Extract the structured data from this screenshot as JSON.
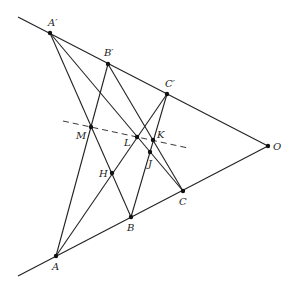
{
  "diagram": {
    "points": {
      "A_prime": {
        "label": "A′",
        "x": 50,
        "y": 33
      },
      "B_prime": {
        "label": "B′",
        "x": 108,
        "y": 64
      },
      "C_prime": {
        "label": "C′",
        "x": 167,
        "y": 94
      },
      "O": {
        "label": "O",
        "x": 268,
        "y": 146
      },
      "A": {
        "label": "A",
        "x": 56,
        "y": 256
      },
      "B": {
        "label": "B",
        "x": 131,
        "y": 217
      },
      "C": {
        "label": "C",
        "x": 183,
        "y": 191
      },
      "M": {
        "label": "M",
        "x": 91,
        "y": 127
      },
      "L": {
        "label": "L",
        "x": 137,
        "y": 137
      },
      "K": {
        "label": "K",
        "x": 153,
        "y": 140
      },
      "J": {
        "label": "J",
        "x": 150,
        "y": 152
      },
      "H": {
        "label": "H",
        "x": 112,
        "y": 173
      }
    },
    "labels": {
      "A_prime": "A′",
      "B_prime": "B′",
      "C_prime": "C′",
      "O": "O",
      "A": "A",
      "B": "B",
      "C": "C",
      "M": "M",
      "L": "L",
      "K": "K",
      "J": "J",
      "H": "H"
    },
    "lines": [
      {
        "from": "ext_top",
        "to": "O",
        "note": "ray through A', B', C'"
      },
      {
        "from": "ext_bottom",
        "to": "O",
        "note": "ray through A, B, C"
      },
      {
        "from": "A_prime",
        "to": "B"
      },
      {
        "from": "A_prime",
        "to": "C"
      },
      {
        "from": "B_prime",
        "to": "A"
      },
      {
        "from": "B_prime",
        "to": "C"
      },
      {
        "from": "C_prime",
        "to": "A"
      },
      {
        "from": "C_prime",
        "to": "B"
      }
    ],
    "dashed_line": {
      "through": [
        "M",
        "L",
        "K"
      ],
      "style": "dashed"
    }
  }
}
